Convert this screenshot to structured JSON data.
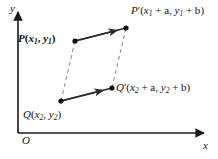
{
  "figure": {
    "type": "coordinate-geometry-diagram",
    "colors": {
      "background": "#ffffff",
      "axis": "#1a1a1a",
      "solid_segment": "#2b2b2b",
      "dashed_segment": "#8a8a8a",
      "point_fill": "#111111",
      "label_text": "#111111"
    }
  },
  "axes": {
    "y_label": "y",
    "x_label": "x",
    "origin_label": "O",
    "x_axis": {
      "x1": 18,
      "y1": 133,
      "x2": 206,
      "y2": 133,
      "arrow": "right"
    },
    "y_axis": {
      "x1": 18,
      "y1": 133,
      "x2": 18,
      "y2": 10,
      "arrow": "up"
    }
  },
  "points": [
    {
      "id": "P",
      "name": "P",
      "bold_name": true,
      "prime": false,
      "coord_x": "x",
      "coord_x_sub": "1",
      "coord_y": "y",
      "coord_y_sub": "1",
      "offset_x": "",
      "offset_y": "",
      "px": 75,
      "py": 41
    },
    {
      "id": "Pprime",
      "name": "P",
      "bold_name": false,
      "prime": true,
      "coord_x": "x",
      "coord_x_sub": "1",
      "coord_y": "y",
      "coord_y_sub": "1",
      "offset_x": "+ a",
      "offset_y": "+ b",
      "px": 126,
      "py": 28
    },
    {
      "id": "Q",
      "name": "Q",
      "bold_name": false,
      "prime": false,
      "coord_x": "x",
      "coord_x_sub": "2",
      "coord_y": "y",
      "coord_y_sub": "2",
      "offset_x": "",
      "offset_y": "",
      "px": 61,
      "py": 101
    },
    {
      "id": "Qprime",
      "name": "Q",
      "bold_name": false,
      "prime": true,
      "coord_x": "x",
      "coord_x_sub": "2",
      "coord_y": "y",
      "coord_y_sub": "2",
      "offset_x": "+ a",
      "offset_y": "+ b",
      "px": 112,
      "py": 88
    }
  ],
  "labels": {
    "y_axis": "y",
    "x_axis": "x",
    "origin": "O",
    "P": {
      "name": "P",
      "open": "(",
      "x": "x",
      "xsub": "1",
      "comma": ", ",
      "y": "y",
      "ysub": "1",
      "close": ")"
    },
    "Pprime": {
      "name": "P",
      "prime": "′",
      "open": "(",
      "x": "x",
      "xsub": "1",
      "plus_a": " + a",
      "comma": ", ",
      "y": "y",
      "ysub": "1",
      "plus_b": " + b",
      "close": ")"
    },
    "Q": {
      "name": "Q",
      "open": "(",
      "x": "x",
      "xsub": "2",
      "comma": ", ",
      "y": "y",
      "ysub": "2",
      "close": ")"
    },
    "Qprime": {
      "name": "Q",
      "prime": "′",
      "open": "(",
      "x": "x",
      "xsub": "2",
      "plus_a": " + a",
      "comma": ", ",
      "y": "y",
      "ysub": "2",
      "plus_b": " + b",
      "close": ")"
    }
  },
  "segments": [
    {
      "id": "P-to-Pprime",
      "style": "solid-arrow",
      "from": "P",
      "to": "Pprime"
    },
    {
      "id": "Q-to-Qprime",
      "style": "solid-arrow",
      "from": "Q",
      "to": "Qprime"
    },
    {
      "id": "P-to-Q",
      "style": "dashed",
      "from": "P",
      "to": "Q"
    },
    {
      "id": "Pprime-to-Qprime",
      "style": "dashed",
      "from": "Pprime",
      "to": "Qprime"
    }
  ]
}
